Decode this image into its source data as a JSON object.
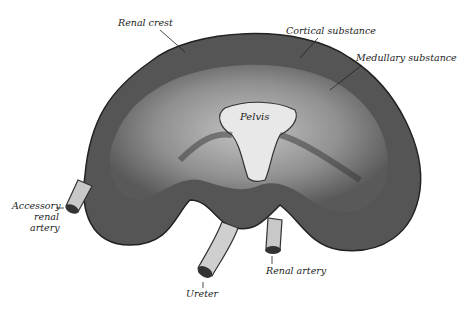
{
  "figure": {
    "labels": {
      "renal_crest": "Renal crest",
      "cortical_substance": "Cortical substance",
      "medullary_substance": "Medullary substance",
      "pelvis": "Pelvis",
      "accessory_renal_artery_1": "Accessory",
      "accessory_renal_artery_2": "renal",
      "accessory_renal_artery_3": "artery",
      "ureter": "Ureter",
      "renal_artery": "Renal artery"
    }
  }
}
